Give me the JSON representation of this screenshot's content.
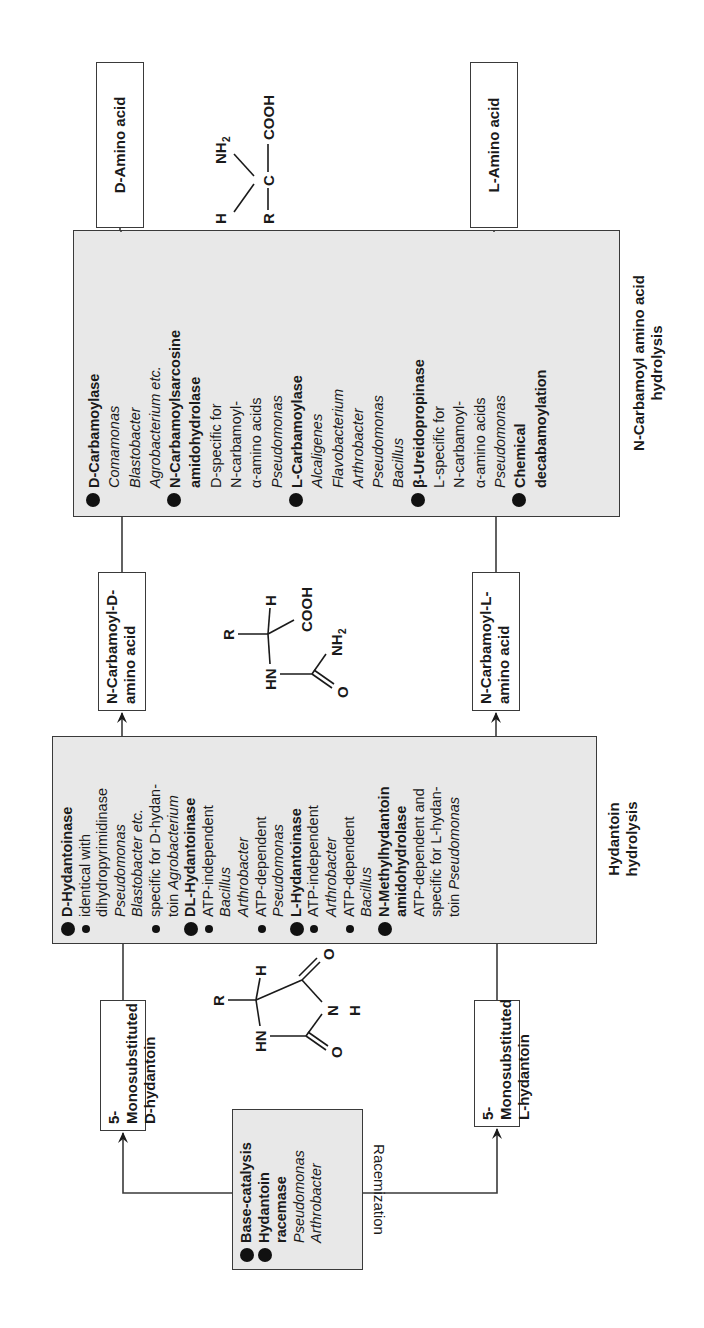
{
  "orientation": "rotated -90deg (text reads bottom-to-top)",
  "stages": {
    "racemization": {
      "caption": "Racemization",
      "items": [
        {
          "bullet": "big",
          "text": "Base-catalysis",
          "style": "bold"
        },
        {
          "bullet": "big",
          "text": "Hydantoin",
          "style": "bold"
        },
        {
          "bullet": "none",
          "text": "racemase",
          "style": "bold"
        },
        {
          "bullet": "none",
          "text": "Pseudomonas",
          "style": "italic"
        },
        {
          "bullet": "none",
          "text": "Arthrobacter",
          "style": "italic"
        }
      ]
    },
    "hydantoin_hydrolysis": {
      "caption_line1": "Hydantoin",
      "caption_line2": "hydrolysis",
      "items": [
        {
          "bullet": "big",
          "text": "D-Hydantoinase",
          "style": "bold"
        },
        {
          "bullet": "small",
          "text": "identical with",
          "style": "normal"
        },
        {
          "bullet": "none",
          "text": "dihydropyrimidinase",
          "style": "normal"
        },
        {
          "bullet": "none",
          "text": "Pseudomonas",
          "style": "italic"
        },
        {
          "bullet": "none",
          "text": "Blastobacter etc.",
          "style": "italic"
        },
        {
          "bullet": "small",
          "text": "specific for D-hydan-",
          "style": "normal"
        },
        {
          "bullet": "none",
          "text": "toin",
          "style": "normal",
          "suffix": "Agrobacterium"
        },
        {
          "bullet": "big",
          "text": "DL-Hydantoinase",
          "style": "bold"
        },
        {
          "bullet": "small",
          "text": "ATP-independent",
          "style": "normal"
        },
        {
          "bullet": "none",
          "text": "Bacillus",
          "style": "italic"
        },
        {
          "bullet": "none",
          "text": "Arthrobacter",
          "style": "italic"
        },
        {
          "bullet": "small",
          "text": "ATP-dependent",
          "style": "normal"
        },
        {
          "bullet": "none",
          "text": "Pseudomonas",
          "style": "italic"
        },
        {
          "bullet": "big",
          "text": "L-Hydantoinase",
          "style": "bold"
        },
        {
          "bullet": "small",
          "text": "ATP-independent",
          "style": "normal"
        },
        {
          "bullet": "none",
          "text": "Arthrobacter",
          "style": "italic"
        },
        {
          "bullet": "small",
          "text": "ATP-dependent",
          "style": "normal"
        },
        {
          "bullet": "none",
          "text": "Bacillus",
          "style": "italic"
        },
        {
          "bullet": "big",
          "text": "N-Methylhydantoin",
          "style": "bold"
        },
        {
          "bullet": "none",
          "text": "amidohydrolase",
          "style": "bold"
        },
        {
          "bullet": "none",
          "text": "ATP-dependent and",
          "style": "normal"
        },
        {
          "bullet": "none",
          "text": "specific for L-hydan-",
          "style": "normal"
        },
        {
          "bullet": "none",
          "text": "toin",
          "style": "normal",
          "suffix": "Pseudomonas"
        }
      ]
    },
    "carbamoyl_hydrolysis": {
      "caption_line1": "N-Carbamoyl amino acid",
      "caption_line2": "hydrolysis",
      "items": [
        {
          "bullet": "big",
          "text": "D-Carbamoylase",
          "style": "bold"
        },
        {
          "bullet": "none",
          "text": "Comamonas",
          "style": "italic"
        },
        {
          "bullet": "none",
          "text": "Blastobacter",
          "style": "italic"
        },
        {
          "bullet": "none",
          "text": "Agrobacterium etc.",
          "style": "italic"
        },
        {
          "bullet": "big",
          "text": "N-Carbamoylsarcosine",
          "style": "bold"
        },
        {
          "bullet": "none",
          "text": "amidohydrolase",
          "style": "bold"
        },
        {
          "bullet": "none",
          "text": "D-specific for",
          "style": "normal"
        },
        {
          "bullet": "none",
          "text": "N-carbamoyl-",
          "style": "normal"
        },
        {
          "bullet": "none",
          "text": "α-amino acids",
          "style": "normal"
        },
        {
          "bullet": "none",
          "text": "Pseudomonas",
          "style": "italic"
        },
        {
          "bullet": "big",
          "text": "L-Carbamoylase",
          "style": "bold"
        },
        {
          "bullet": "none",
          "text": "Alcaligenes",
          "style": "italic"
        },
        {
          "bullet": "none",
          "text": "Flavobacterium",
          "style": "italic"
        },
        {
          "bullet": "none",
          "text": "Arthrobacter",
          "style": "italic"
        },
        {
          "bullet": "none",
          "text": "Pseudomonas",
          "style": "italic"
        },
        {
          "bullet": "none",
          "text": "Bacillus",
          "style": "italic"
        },
        {
          "bullet": "big",
          "text": "β-Ureidopropinase",
          "style": "bold"
        },
        {
          "bullet": "none",
          "text": "L-specific for",
          "style": "normal"
        },
        {
          "bullet": "none",
          "text": "N-carbamoyl-",
          "style": "normal"
        },
        {
          "bullet": "none",
          "text": "α-amino acids",
          "style": "normal"
        },
        {
          "bullet": "none",
          "text": "Pseudomonas",
          "style": "italic"
        },
        {
          "bullet": "big",
          "text": "Chemical",
          "style": "bold"
        },
        {
          "bullet": "none",
          "text": "decabamoylation",
          "style": "bold"
        }
      ]
    }
  },
  "compounds": {
    "d_hydantoin": {
      "line1": "5-Monosubstituted",
      "line2": "D-hydantoin"
    },
    "l_hydantoin": {
      "line1": "5-Monosubstituted",
      "line2": "L-hydantoin"
    },
    "n_carbamoyl_d": {
      "line1": "N-Carbamoyl-D-",
      "line2": "amino acid"
    },
    "n_carbamoyl_l": {
      "line1": "N-Carbamoyl-L-",
      "line2": "amino acid"
    },
    "d_amino_acid": {
      "label": "D-Amino acid"
    },
    "l_amino_acid": {
      "label": "L-Amino acid"
    }
  },
  "structures": {
    "hydantoin": {
      "atoms": [
        "R",
        "H",
        "HN",
        "O",
        "N",
        "H",
        "O"
      ]
    },
    "carbamoyl_amino_acid": {
      "atoms": [
        "R",
        "H",
        "HN",
        "COOH",
        "O",
        "NH2"
      ]
    },
    "amino_acid": {
      "atoms": [
        "H",
        "NH2",
        "R",
        "C",
        "COOH"
      ]
    }
  },
  "colors": {
    "box_fill": "#e8e8e8",
    "border": "#3a3a3a",
    "text": "#1a1a1a",
    "background": "#ffffff"
  }
}
